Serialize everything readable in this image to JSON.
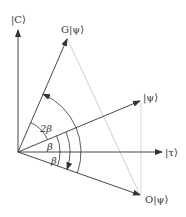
{
  "diagram": {
    "colors": {
      "line": "#333333",
      "guide": "#c8c8c8"
    },
    "vectors": [
      {
        "id": "C",
        "label": "|C⟩",
        "angle_deg": 90
      },
      {
        "id": "G",
        "label": "G|ψ⟩",
        "angle_deg": 66.7
      },
      {
        "id": "psi",
        "label": "|ψ⟩",
        "angle_deg": 22.7
      },
      {
        "id": "tau",
        "label": "|τ⟩",
        "angle_deg": 0
      },
      {
        "id": "O",
        "label": "O|ψ⟩",
        "angle_deg": -19.4
      }
    ],
    "angle_labels": {
      "two_beta": "2β",
      "beta_upper": "β",
      "beta_lower": "β"
    }
  }
}
